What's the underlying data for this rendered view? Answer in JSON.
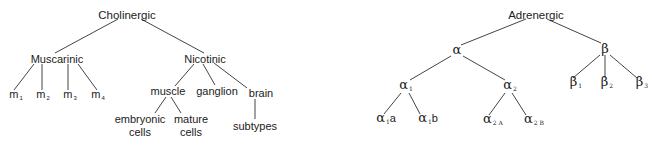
{
  "diagrams": {
    "cholinergic": {
      "root": "Cholinergic",
      "muscarinic": {
        "label": "Muscarinic",
        "children": [
          {
            "base": "m",
            "sub": "1"
          },
          {
            "base": "m",
            "sub": "2"
          },
          {
            "base": "m",
            "sub": "3"
          },
          {
            "base": "m",
            "sub": "4"
          }
        ]
      },
      "nicotinic": {
        "label": "Nicotinic",
        "muscle": {
          "label": "muscle",
          "children": [
            {
              "line1": "embryonic",
              "line2": "cells"
            },
            {
              "line1": "mature",
              "line2": "cells"
            }
          ]
        },
        "ganglion": "ganglion",
        "brain": {
          "label": "brain",
          "child": "subtypes"
        }
      }
    },
    "adrenergic": {
      "root": "Adrenergic",
      "alpha": {
        "label": "α",
        "alpha1": {
          "base": "α",
          "sub": "1",
          "children": [
            {
              "base": "α",
              "sub": "1",
              "suffix": "a"
            },
            {
              "base": "α",
              "sub": "1",
              "suffix": "b"
            }
          ]
        },
        "alpha2": {
          "base": "α",
          "sub": "2",
          "children": [
            {
              "base": "α",
              "sub": "2 A",
              "suffix": ""
            },
            {
              "base": "α",
              "sub": "2 B",
              "suffix": ""
            }
          ]
        }
      },
      "beta": {
        "label": "β",
        "children": [
          {
            "base": "β",
            "sub": "1"
          },
          {
            "base": "β",
            "sub": "2"
          },
          {
            "base": "β",
            "sub": "3"
          }
        ]
      }
    }
  },
  "colors": {
    "text": "#222222",
    "lines": "#444444",
    "background": "#ffffff"
  }
}
